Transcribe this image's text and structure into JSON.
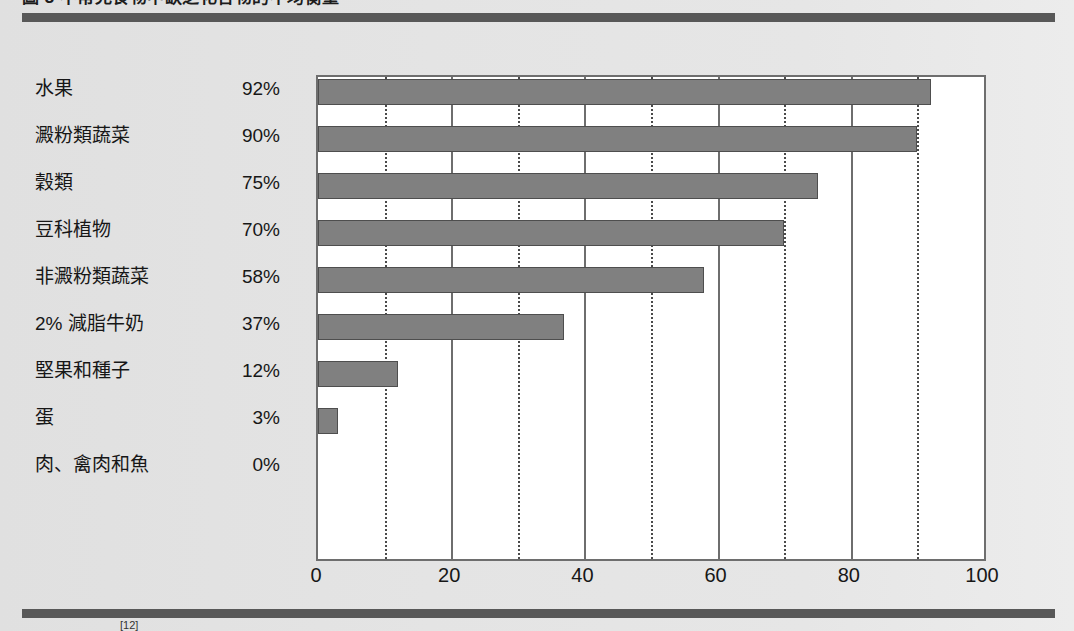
{
  "figure": {
    "caption": "圖 3  不常見食物中缺乏化合物的不均衡量",
    "footnote_marker": "[12]"
  },
  "chart_data": {
    "type": "bar",
    "orientation": "horizontal",
    "title": "",
    "xlabel": "",
    "ylabel": "",
    "xlim": [
      0,
      100
    ],
    "xticks": [
      0,
      20,
      40,
      60,
      80,
      100
    ],
    "xtick_labels": [
      "0",
      "20",
      "40",
      "60",
      "80",
      "100"
    ],
    "minor_gridlines": [
      10,
      30,
      50,
      70,
      90
    ],
    "grid": true,
    "legend": "none",
    "bar_color": "#808080",
    "categories": [
      "水果",
      "澱粉類蔬菜",
      "穀類",
      "豆科植物",
      "非澱粉類蔬菜",
      "2% 減脂牛奶",
      "堅果和種子",
      "蛋",
      "肉、禽肉和魚"
    ],
    "values": [
      92,
      90,
      75,
      70,
      58,
      37,
      12,
      3,
      0
    ],
    "value_labels": [
      "92%",
      "90%",
      "75%",
      "70%",
      "58%",
      "37%",
      "12%",
      "3%",
      "0%"
    ]
  }
}
